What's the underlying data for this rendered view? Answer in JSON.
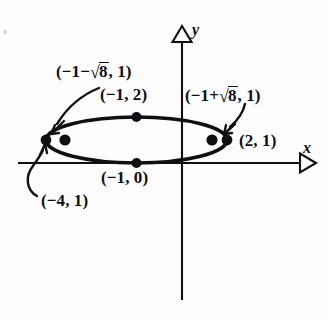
{
  "figure": {
    "type": "conic-section-ellipse-diagram",
    "background_color": "#fdfdfe",
    "ink_color": "#101014"
  },
  "axes": {
    "x_label": "x",
    "y_label": "y",
    "origin": {
      "px": 182,
      "py": 163
    },
    "x_axis": {
      "from_px": 18,
      "to_px": 316,
      "py": 163,
      "arrow": "open-triangle-right"
    },
    "y_axis": {
      "px": 182,
      "from_py": 300,
      "to_py": 26,
      "arrow": "open-triangle-up"
    }
  },
  "curve": {
    "shape": "ellipse",
    "center": {
      "x": -1,
      "y": 1
    },
    "semi_major_a": 3,
    "semi_minor_b": 1,
    "orientation": "horizontal",
    "equation": "(x+1)^2/9 + (y-1)^2/1 = 1",
    "center_px": {
      "cx": 136.5,
      "cy": 140
    },
    "radius_px": {
      "rx": 90.5,
      "ry": 23
    }
  },
  "points": [
    {
      "id": "left-vertex",
      "label": "(−4, 1)",
      "coords": {
        "x": -4,
        "y": 1
      },
      "role": "vertex",
      "marker": "filled-dot",
      "px": 46,
      "py": 140
    },
    {
      "id": "right-vertex",
      "label": "(2, 1)",
      "coords": {
        "x": 2,
        "y": 1
      },
      "role": "vertex",
      "marker": "filled-dot",
      "px": 227,
      "py": 140
    },
    {
      "id": "top-covertex",
      "label": "(−1, 2)",
      "coords": {
        "x": -1,
        "y": 2
      },
      "role": "co-vertex",
      "marker": "filled-dot",
      "px": 136.5,
      "py": 117
    },
    {
      "id": "bottom-covertex",
      "label": "(−1, 0)",
      "coords": {
        "x": -1,
        "y": 0
      },
      "role": "co-vertex",
      "marker": "filled-dot",
      "px": 136.5,
      "py": 163
    },
    {
      "id": "left-focus",
      "label_parts": {
        "prefix": "(−1−",
        "radical": "8",
        "suffix": ", 1)"
      },
      "label_plain": "(−1−√8, 1)",
      "role": "focus",
      "marker": "filled-dot",
      "px": 65,
      "py": 140
    },
    {
      "id": "right-focus",
      "label_parts": {
        "prefix": "(−1+",
        "radical": "8",
        "suffix": ", 1)"
      },
      "label_plain": "(−1+√8, 1)",
      "role": "focus",
      "marker": "filled-dot",
      "px": 212,
      "py": 140
    }
  ],
  "labels": {
    "left_focus": {
      "prefix": "(−1−",
      "radicand": "8",
      "suffix": ", 1)"
    },
    "right_focus": {
      "prefix": "(−1+",
      "radicand": "8",
      "suffix": ", 1)"
    },
    "top_covertex": "(−1, 2)",
    "bottom_covertex": "(−1, 0)",
    "right_vertex": "(2, 1)",
    "left_vertex": "(−4, 1)"
  },
  "leader_arrows": [
    {
      "id": "left-focus-leader",
      "from": "left-focus-label",
      "to": "left-vertex",
      "style": "curved-arrow"
    },
    {
      "id": "right-focus-leader",
      "from": "right-focus-label",
      "to": "right-vertex",
      "style": "curved-arrow"
    },
    {
      "id": "left-vertex-leader",
      "from": "left-vertex-label",
      "to": "left-vertex",
      "style": "curved-arrow"
    }
  ]
}
